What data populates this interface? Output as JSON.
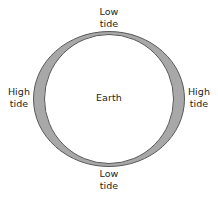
{
  "diagram": {
    "background_color": "#ffffff",
    "ocean_color": "#a8a8a8",
    "earth_color": "#ffffff",
    "outline_color": "#58595b",
    "text_color": "#231f20",
    "labels": {
      "top": {
        "line1": "Low",
        "line2": "tide"
      },
      "bottom": {
        "line1": "Low",
        "line2": "tide"
      },
      "left": {
        "line1": "High",
        "line2": "tide"
      },
      "right": {
        "line1": "High",
        "line2": "tide"
      },
      "center": {
        "line1": "Earth"
      }
    }
  },
  "chart_data": {
    "type": "diagram",
    "shapes": [
      {
        "name": "ocean-envelope",
        "type": "ellipse",
        "cx": 109,
        "cy": 99,
        "rx": 76,
        "ry": 68,
        "fill": "#a8a8a8",
        "stroke": "#58595b"
      },
      {
        "name": "earth-body",
        "type": "circle",
        "cx": 109,
        "cy": 99,
        "r": 65,
        "fill": "#ffffff",
        "stroke": "#58595b"
      }
    ],
    "annotations": [
      {
        "position": "top",
        "text": "Low tide"
      },
      {
        "position": "bottom",
        "text": "Low tide"
      },
      {
        "position": "left",
        "text": "High tide"
      },
      {
        "position": "right",
        "text": "High tide"
      },
      {
        "position": "center",
        "text": "Earth"
      }
    ]
  }
}
